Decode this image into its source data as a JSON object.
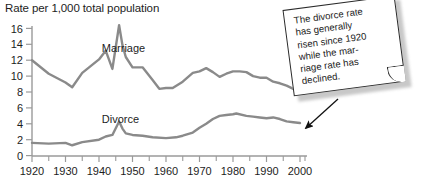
{
  "chart_data": {
    "type": "line",
    "title": "Rate per 1,000 total population",
    "xlabel": "",
    "ylabel": "Rate per 1,000 total population",
    "xlim": [
      1920,
      2002
    ],
    "ylim": [
      0,
      17
    ],
    "grid": false,
    "legend_position": "inline-labels",
    "y_ticks": [
      0,
      2,
      4,
      6,
      8,
      10,
      12,
      14,
      16
    ],
    "y_tick_labels": [
      "0",
      "2",
      "4",
      "6",
      "8",
      "10",
      "12",
      "14",
      "16"
    ],
    "x_ticks": [
      1920,
      1930,
      1940,
      1950,
      1960,
      1970,
      1980,
      1990,
      2000
    ],
    "x_tick_labels": [
      "1920",
      "1930",
      "1940",
      "1950",
      "1960",
      "1970",
      "1980",
      "1990",
      "2000"
    ],
    "x_minor_ticks": [
      1925,
      1935,
      1945,
      1955,
      1965,
      1975,
      1985,
      1995
    ],
    "line_color": "#8a8a8a",
    "axis_color": "#9a9a9a",
    "series": [
      {
        "name": "Marriage",
        "label_x": 1948,
        "label_y": 13.5,
        "x": [
          1920,
          1925,
          1930,
          1932,
          1935,
          1940,
          1942,
          1944,
          1946,
          1947,
          1948,
          1950,
          1953,
          1956,
          1958,
          1960,
          1962,
          1965,
          1968,
          1970,
          1972,
          1974,
          1976,
          1978,
          1980,
          1982,
          1984,
          1986,
          1988,
          1990,
          1992,
          1994,
          1996,
          1998,
          2000
        ],
        "values": [
          12.0,
          10.3,
          9.2,
          8.6,
          10.4,
          12.1,
          13.2,
          10.9,
          16.4,
          13.9,
          12.4,
          11.1,
          11.1,
          9.5,
          8.4,
          8.5,
          8.5,
          9.3,
          10.4,
          10.6,
          11.0,
          10.5,
          9.9,
          10.3,
          10.6,
          10.6,
          10.5,
          10.0,
          9.8,
          9.8,
          9.3,
          9.1,
          8.8,
          8.4,
          8.3
        ]
      },
      {
        "name": "Divorce",
        "label_x": 1948,
        "label_y": 4.6,
        "x": [
          1920,
          1925,
          1930,
          1932,
          1935,
          1940,
          1942,
          1944,
          1946,
          1947,
          1948,
          1950,
          1953,
          1956,
          1960,
          1963,
          1965,
          1968,
          1970,
          1972,
          1974,
          1976,
          1978,
          1980,
          1981,
          1984,
          1986,
          1988,
          1990,
          1992,
          1994,
          1996,
          1998,
          2000
        ],
        "values": [
          1.6,
          1.5,
          1.6,
          1.3,
          1.7,
          2.0,
          2.4,
          2.6,
          4.3,
          3.4,
          2.8,
          2.6,
          2.5,
          2.3,
          2.2,
          2.3,
          2.5,
          2.9,
          3.5,
          4.0,
          4.6,
          5.0,
          5.1,
          5.2,
          5.3,
          5.0,
          4.9,
          4.8,
          4.7,
          4.8,
          4.6,
          4.3,
          4.2,
          4.1
        ]
      }
    ],
    "annotation": {
      "text": "The divorce rate has generally risen since 1920 while the mar-⁠riage rate has declined.",
      "text_lines": "The divorce rate\nhas generally\nrisen since 1920\nwhile the mar-\nriage rate has\ndeclined.",
      "points_to_series": "Divorce",
      "points_to_x": 2000
    }
  }
}
